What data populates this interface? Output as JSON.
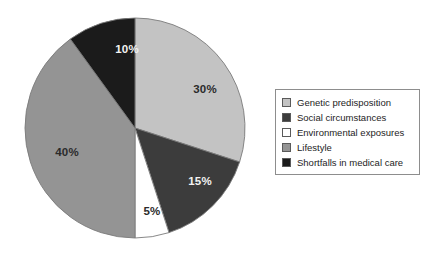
{
  "chart_data": {
    "type": "pie",
    "title": "",
    "subtitle": "",
    "xlabel": "",
    "ylabel": "",
    "legend_position": "right",
    "grid": false,
    "start_angle_deg": 0,
    "direction": "clockwise",
    "categories": [
      "Genetic predisposition",
      "Social circumstances",
      "Environmental exposures",
      "Lifestyle",
      "Shortfalls in medical care"
    ],
    "values": [
      30,
      15,
      5,
      40,
      10
    ],
    "value_labels": [
      "30%",
      "15%",
      "5%",
      "40%",
      "10%"
    ],
    "colors": [
      "#c3c3c3",
      "#3c3c3c",
      "#ffffff",
      "#949494",
      "#1b1b1b"
    ],
    "label_text_colors": [
      "#2b2b2b",
      "#f2f2f2",
      "#2b2b2b",
      "#2b2b2b",
      "#f2f2f2"
    ],
    "slices": [
      {
        "name": "Genetic predisposition",
        "value": 30,
        "label": "30%",
        "color": "#c3c3c3",
        "label_x": 205,
        "label_y": 90,
        "label_color": "dark"
      },
      {
        "name": "Social circumstances",
        "value": 15,
        "label": "15%",
        "color": "#3c3c3c",
        "label_x": 200,
        "label_y": 182,
        "label_color": "light"
      },
      {
        "name": "Environmental exposures",
        "value": 5,
        "label": "5%",
        "color": "#ffffff",
        "label_x": 152,
        "label_y": 212,
        "label_color": "dark"
      },
      {
        "name": "Lifestyle",
        "value": 40,
        "label": "40%",
        "color": "#949494",
        "label_x": 67,
        "label_y": 153,
        "label_color": "dark"
      },
      {
        "name": "Shortfalls in medical care",
        "value": 10,
        "label": "10%",
        "color": "#1b1b1b",
        "label_x": 127,
        "label_y": 50,
        "label_color": "light"
      }
    ],
    "geometry": {
      "center_x": 135,
      "center_y": 128,
      "radius": 110
    }
  },
  "legend": {
    "items": [
      {
        "label": "Genetic predisposition",
        "color": "#c3c3c3"
      },
      {
        "label": "Social circumstances",
        "color": "#3c3c3c"
      },
      {
        "label": "Environmental exposures",
        "color": "#ffffff"
      },
      {
        "label": "Lifestyle",
        "color": "#949494"
      },
      {
        "label": "Shortfalls in medical care",
        "color": "#1b1b1b"
      }
    ]
  }
}
